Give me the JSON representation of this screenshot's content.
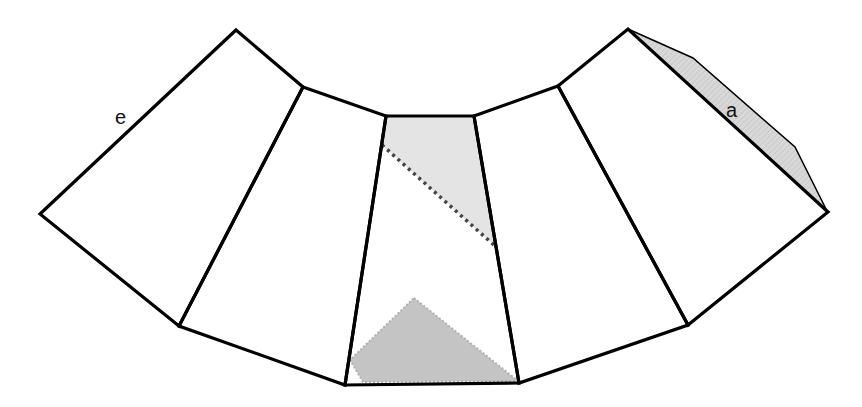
{
  "diagram": {
    "labels": {
      "edge_left": "e",
      "edge_right": "a"
    },
    "faces": [
      "face-1",
      "face-2",
      "face-3",
      "face-4",
      "face-5",
      "face-6"
    ],
    "highlights": {
      "center_face_top_region": {
        "fill": "#e3e3e3",
        "style": "light gray shading with dotted diagonal boundary"
      },
      "center_face_bottom_triangle": {
        "fill": "#c2c2c2",
        "style": "gray triangle with jagged edges"
      },
      "right_flap": {
        "fill": "#d6d6d6",
        "style": "gray hatched flap along edge a"
      }
    },
    "colors": {
      "stroke": "#000000",
      "dotted": "#444444",
      "background": "#ffffff"
    }
  }
}
